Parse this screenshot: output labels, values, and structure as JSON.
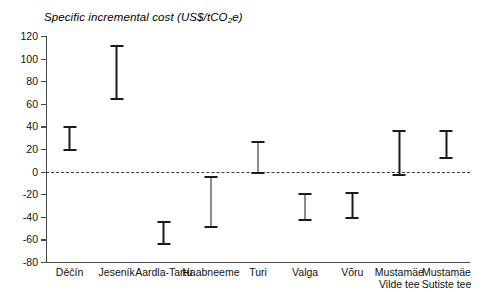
{
  "chart_data": {
    "type": "bar",
    "subtype": "range-error-bar",
    "title": "Specific incremental cost (US$/tCO2e)",
    "title_prefix": "Specific incremental cost (US$/tCO",
    "title_sub": "2",
    "title_suffix": "e)",
    "xlabel": "",
    "ylabel": "",
    "ylim": [
      -80,
      120
    ],
    "ytick_step": 20,
    "yticks": [
      120,
      100,
      80,
      60,
      40,
      20,
      0,
      -20,
      -40,
      -60,
      -80
    ],
    "ytick_labels": [
      "120",
      "100",
      "80",
      "60",
      "40",
      "20",
      "0",
      "-20",
      "-40",
      "-60",
      "-80"
    ],
    "grid": false,
    "legend": false,
    "zero_reference_line": 0,
    "zero_line_style": "dashed",
    "categories": [
      "Děčín",
      "Jeseník",
      "Aardla-Tartu",
      "Haabneeme",
      "Turi",
      "Valga",
      "Võru",
      "Mustamäe Vilde tee",
      "Mustamäe Sutiste tee"
    ],
    "category_lines": [
      [
        "Děčín"
      ],
      [
        "Jeseník"
      ],
      [
        "Aardla-Tartu"
      ],
      [
        "Haabneeme"
      ],
      [
        "Turi"
      ],
      [
        "Valga"
      ],
      [
        "Võru"
      ],
      [
        "Mustamäe",
        "Vilde tee"
      ],
      [
        "Mustamäe",
        "Sutiste tee"
      ]
    ],
    "series": [
      {
        "name": "Specific incremental cost range",
        "low": [
          18,
          63,
          -65,
          -50,
          -2,
          -44,
          -42,
          -4,
          11
        ],
        "high": [
          40,
          112,
          -44,
          -4,
          27,
          -19,
          -18,
          37,
          37
        ]
      }
    ],
    "units": "US$/tCO2e",
    "colors": {
      "bar": "#1a1a1a",
      "axis": "#4a4a4a",
      "zero_line": "#3b3b3b",
      "background": "#ffffff",
      "text": "#111111"
    }
  }
}
